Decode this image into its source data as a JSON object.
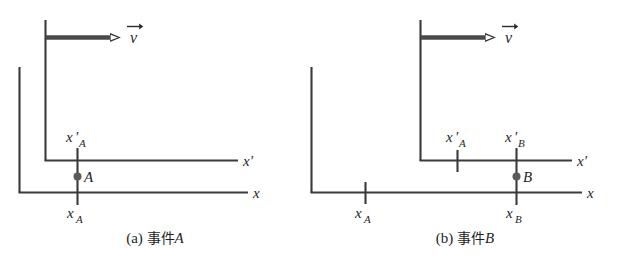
{
  "figure": {
    "type": "physics-reference-frame-diagram",
    "colors": {
      "background": "#ffffff",
      "line": "#3a3a3a",
      "arrow": "#4a4a4a",
      "dot": "#5a5a5a",
      "text": "#1f1f1f"
    }
  },
  "panels": [
    {
      "id": "a",
      "caption": {
        "index": "(a)",
        "cjk": "事件",
        "symbol": "A",
        "full": "(a) 事件A"
      },
      "velocity": {
        "label": "v",
        "accent": "vector-arrow",
        "direction": "right"
      },
      "axes": [
        {
          "name": "x",
          "label": "x",
          "frame": "stationary"
        },
        {
          "name": "x'",
          "label": "x'",
          "frame": "moving"
        }
      ],
      "event": {
        "name": "A",
        "dot_label": "A",
        "coordinate_stationary": "x_A",
        "coordinate_moving": "x'_A",
        "coordinate_stationary_base": "x",
        "coordinate_stationary_sub": "A",
        "coordinate_moving_base": "x",
        "coordinate_moving_sub": "A"
      },
      "ticks": [
        {
          "label": "x'_A",
          "base": "x",
          "sub": "A",
          "prime": true,
          "axis": "x'",
          "spans_both_axes": true
        },
        {
          "label": "x_A",
          "base": "x",
          "sub": "A",
          "prime": false,
          "axis": "x",
          "spans_both_axes": true
        }
      ]
    },
    {
      "id": "b",
      "caption": {
        "index": "(b)",
        "cjk": "事件",
        "symbol": "B",
        "full": "(b) 事件B"
      },
      "velocity": {
        "label": "v",
        "accent": "vector-arrow",
        "direction": "right"
      },
      "axes": [
        {
          "name": "x",
          "label": "x",
          "frame": "stationary"
        },
        {
          "name": "x'",
          "label": "x'",
          "frame": "moving"
        }
      ],
      "event": {
        "name": "B",
        "dot_label": "B",
        "coordinate_stationary": "x_B",
        "coordinate_moving": "x'_B",
        "coordinate_stationary_base": "x",
        "coordinate_stationary_sub": "B",
        "coordinate_moving_base": "x",
        "coordinate_moving_sub": "B"
      },
      "ticks": [
        {
          "label": "x'_A",
          "base": "x",
          "sub": "A",
          "prime": true,
          "axis": "x'",
          "spans_both_axes": false
        },
        {
          "label": "x'_B",
          "base": "x",
          "sub": "B",
          "prime": true,
          "axis": "x'",
          "spans_both_axes": true
        },
        {
          "label": "x_A",
          "base": "x",
          "sub": "A",
          "prime": false,
          "axis": "x",
          "spans_both_axes": false
        },
        {
          "label": "x_B",
          "base": "x",
          "sub": "B",
          "prime": false,
          "axis": "x",
          "spans_both_axes": true
        }
      ]
    }
  ]
}
